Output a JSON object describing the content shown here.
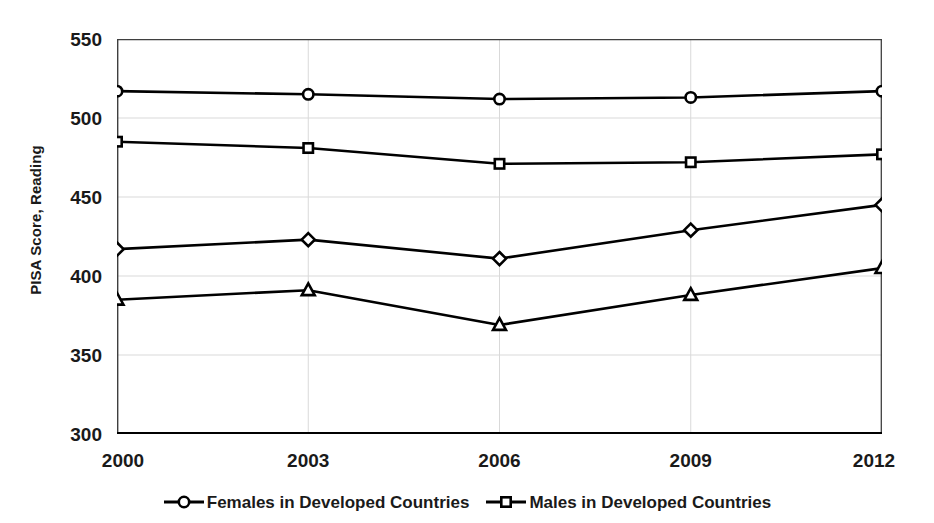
{
  "chart_data": {
    "type": "line",
    "title": "",
    "subtitle": "",
    "xlabel": "",
    "ylabel": "PISA Score, Reading",
    "x": [
      2000,
      2003,
      2006,
      2009,
      2012
    ],
    "categories": [
      "2000",
      "2003",
      "2006",
      "2009",
      "2012"
    ],
    "xlim": [
      2000,
      2012
    ],
    "ylim": [
      300,
      550
    ],
    "yticks": [
      300,
      350,
      400,
      450,
      500,
      550
    ],
    "ytick_labels": [
      "300",
      "350",
      "400",
      "450",
      "500",
      "550"
    ],
    "xtick_labels": [
      "2000",
      "2003",
      "2006",
      "2009",
      "2012"
    ],
    "grid": "horizontal-only-light",
    "legend_position": "bottom-center",
    "series": [
      {
        "name": "Females in Developed Countries",
        "marker": "circle",
        "color": "#000000",
        "values": [
          517,
          515,
          512,
          513,
          517
        ]
      },
      {
        "name": "Males in Developed Countries",
        "marker": "square",
        "color": "#000000",
        "values": [
          485,
          481,
          471,
          472,
          477
        ]
      },
      {
        "name": "",
        "marker": "diamond",
        "color": "#000000",
        "values": [
          417,
          423,
          411,
          429,
          445
        ]
      },
      {
        "name": "",
        "marker": "triangle",
        "color": "#000000",
        "values": [
          385,
          391,
          369,
          388,
          405
        ]
      }
    ],
    "annotations": []
  },
  "axis": {
    "y_title": "PISA Score, Reading",
    "y_ticks": [
      "550",
      "500",
      "450",
      "400",
      "350",
      "300"
    ],
    "x_ticks": [
      "2000",
      "2003",
      "2006",
      "2009",
      "2012"
    ]
  },
  "legend": {
    "entries": [
      {
        "label": "Females in Developed Countries",
        "marker": "circle"
      },
      {
        "label": "Males in Developed Countries",
        "marker": "square"
      }
    ]
  },
  "colors": {
    "ink": "#000000",
    "gridline": "#d9d9d9",
    "axis_line": "#3f3f3f",
    "background": "#ffffff"
  }
}
